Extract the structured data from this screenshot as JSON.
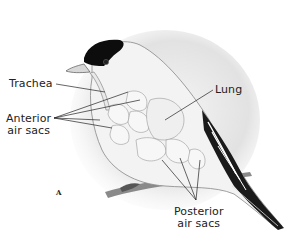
{
  "figure": {
    "panel_letter": "A",
    "labels": {
      "trachea": "Trachea",
      "anterior_line1": "Anterior",
      "anterior_line2": "air sacs",
      "lung": "Lung",
      "posterior_line1": "Posterior",
      "posterior_line2": "air sacs"
    }
  }
}
